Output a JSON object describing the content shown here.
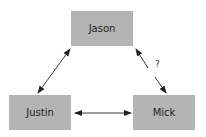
{
  "nodes": [
    {
      "id": "jason",
      "label": "Jason",
      "x": 71,
      "y": 11,
      "w": 62,
      "h": 35
    },
    {
      "id": "justin",
      "label": "Justin",
      "x": 9,
      "y": 95,
      "w": 62,
      "h": 35
    },
    {
      "id": "mick",
      "label": "Mick",
      "x": 133,
      "y": 95,
      "w": 62,
      "h": 35
    }
  ],
  "edges": [
    {
      "from": "justin",
      "to": "jason",
      "bidirectional": true,
      "label": ""
    },
    {
      "from": "jason",
      "to": "mick",
      "bidirectional": true,
      "label": "?"
    },
    {
      "from": "justin",
      "to": "mick",
      "bidirectional": true,
      "label": ""
    }
  ],
  "edge_label_question": "?",
  "colors": {
    "node_fill": "#b4b4b4",
    "edge": "#222222",
    "text": "#222222"
  }
}
